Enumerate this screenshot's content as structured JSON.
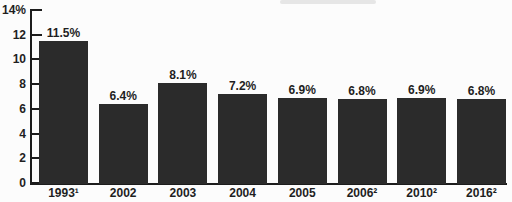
{
  "colors": {
    "bar": "#2b2b2b",
    "axis": "#1c1c1c",
    "text": "#1f1f1f",
    "background": "#fcfcfc",
    "remnant": "#e0e0e0"
  },
  "chart_data": {
    "type": "bar",
    "title": "",
    "xlabel": "",
    "ylabel": "",
    "categories": [
      "1993¹",
      "2002",
      "2003",
      "2004",
      "2005",
      "2006²",
      "2010²",
      "2016²"
    ],
    "values": [
      11.5,
      6.4,
      8.1,
      7.2,
      6.9,
      6.8,
      6.9,
      6.8
    ],
    "value_labels": [
      "11.5%",
      "6.4%",
      "8.1%",
      "7.2%",
      "6.9%",
      "6.8%",
      "6.9%",
      "6.8%"
    ],
    "ylim": [
      0,
      14
    ],
    "yticks": [
      0,
      2,
      4,
      6,
      8,
      10,
      12,
      14
    ],
    "ytick_labels": [
      "0",
      "2",
      "4",
      "6",
      "8",
      "10",
      "12",
      "14%"
    ],
    "grid": false,
    "legend": false
  }
}
